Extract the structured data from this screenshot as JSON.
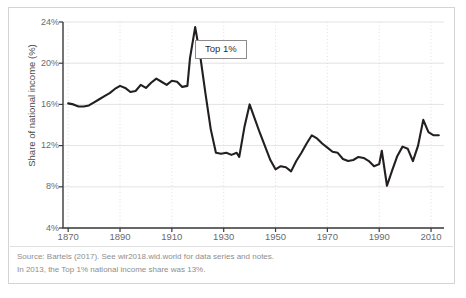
{
  "figure": {
    "annotation_label": "Top 1%",
    "y_axis_title": "Share of national income (%)",
    "source_note": "Source: Bartels (2017). See wir2018.wid.world for data series and notes.",
    "fact_note": "In 2013, the Top 1% national income share was 13%.",
    "colors": {
      "line": "#231f20",
      "grid": "#dcdcdc",
      "axis": "#3a3a3a",
      "tick_text": "#6a6a6a",
      "note_text": "#8e8e8e",
      "frame": "#d4d4d4"
    }
  },
  "chart_data": {
    "type": "line",
    "title": "",
    "subtitle": "",
    "xlabel": "",
    "ylabel": "Share of national income (%)",
    "xlim": [
      1868,
      2015
    ],
    "ylim": [
      4,
      24
    ],
    "xticks": [
      1870,
      1890,
      1910,
      1930,
      1950,
      1970,
      1990,
      2010
    ],
    "xtick_labels": [
      "1870",
      "1890",
      "1910",
      "1930",
      "1950",
      "1970",
      "1990",
      "2010"
    ],
    "yticks": [
      4,
      8,
      12,
      16,
      20,
      24
    ],
    "ytick_labels": [
      "4%",
      "8%",
      "12%",
      "16%",
      "20%",
      "24%"
    ],
    "grid": {
      "horizontal": true,
      "vertical": true,
      "vertical_style": "dotted"
    },
    "legend": {
      "show": false,
      "position": "none"
    },
    "annotations": [
      {
        "text": "Top 1%",
        "x": 1922,
        "y": 22.1,
        "boxed": true
      }
    ],
    "series": [
      {
        "name": "Top 1%",
        "color": "#231f20",
        "x": [
          1870,
          1872,
          1874,
          1876,
          1878,
          1880,
          1882,
          1884,
          1886,
          1888,
          1890,
          1892,
          1894,
          1896,
          1898,
          1900,
          1902,
          1904,
          1906,
          1908,
          1910,
          1912,
          1914,
          1916,
          1917,
          1919,
          1921,
          1923,
          1925,
          1927,
          1929,
          1931,
          1933,
          1935,
          1936,
          1938,
          1940,
          1942,
          1944,
          1946,
          1948,
          1950,
          1952,
          1954,
          1956,
          1958,
          1960,
          1962,
          1964,
          1966,
          1968,
          1970,
          1972,
          1974,
          1976,
          1978,
          1980,
          1982,
          1984,
          1986,
          1988,
          1990,
          1991,
          1993,
          1995,
          1997,
          1999,
          2001,
          2003,
          2005,
          2007,
          2009,
          2011,
          2013
        ],
        "values": [
          16.1,
          16.0,
          15.8,
          15.8,
          15.9,
          16.2,
          16.5,
          16.8,
          17.1,
          17.5,
          17.8,
          17.6,
          17.2,
          17.3,
          17.9,
          17.6,
          18.1,
          18.5,
          18.2,
          17.9,
          18.3,
          18.2,
          17.7,
          17.8,
          20.5,
          23.5,
          20.6,
          17.0,
          13.6,
          11.3,
          11.2,
          11.3,
          11.1,
          11.3,
          10.9,
          13.8,
          16.0,
          14.6,
          13.2,
          11.9,
          10.6,
          9.7,
          10.0,
          9.9,
          9.5,
          10.5,
          11.3,
          12.2,
          13.0,
          12.7,
          12.2,
          11.8,
          11.4,
          11.3,
          10.7,
          10.5,
          10.6,
          10.9,
          10.8,
          10.5,
          10.0,
          10.2,
          11.5,
          8.1,
          9.6,
          11.0,
          11.9,
          11.7,
          10.5,
          12.0,
          14.5,
          13.3,
          13.0,
          13.0
        ]
      }
    ]
  }
}
